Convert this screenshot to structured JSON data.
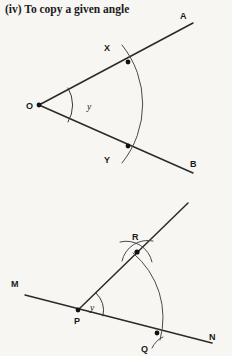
{
  "page": {
    "background_color": "#f7f6f2",
    "ink_color": "#2a2a2a",
    "width": 232,
    "height": 356
  },
  "title": {
    "text": "(iv) To copy a given angle"
  },
  "figures": [
    {
      "id": "given-angle",
      "caption_role": "original angle to be copied",
      "labels": {
        "vertex": "O",
        "ray_end_upper": "A",
        "ray_end_lower": "B",
        "arc_point_upper": "X",
        "arc_point_lower": "Y",
        "angle": "y"
      },
      "geometry": {
        "vertex": [
          39,
          105
        ],
        "ray_upper_end": [
          193,
          23
        ],
        "ray_lower_end": [
          193,
          173
        ],
        "point_X": [
          128,
          62
        ],
        "point_Y": [
          128,
          146
        ],
        "arc_radius": 94,
        "angle_arc_radius": 33
      }
    },
    {
      "id": "copied-angle",
      "caption_role": "constructed copy of the angle",
      "labels": {
        "vertex": "P",
        "line_end_left": "M",
        "line_end_right": "N",
        "arc_point_upper": "R",
        "arc_point_lower": "Q",
        "angle": "y"
      },
      "geometry": {
        "vertex": [
          78,
          310
        ],
        "line_left_end": [
          25,
          295
        ],
        "line_right_end": [
          212,
          343
        ],
        "ray_end": [
          188,
          203
        ],
        "point_R": [
          137,
          250
        ],
        "point_Q": [
          157,
          332
        ],
        "arc_radius": 84,
        "cross_marks": true
      }
    }
  ]
}
